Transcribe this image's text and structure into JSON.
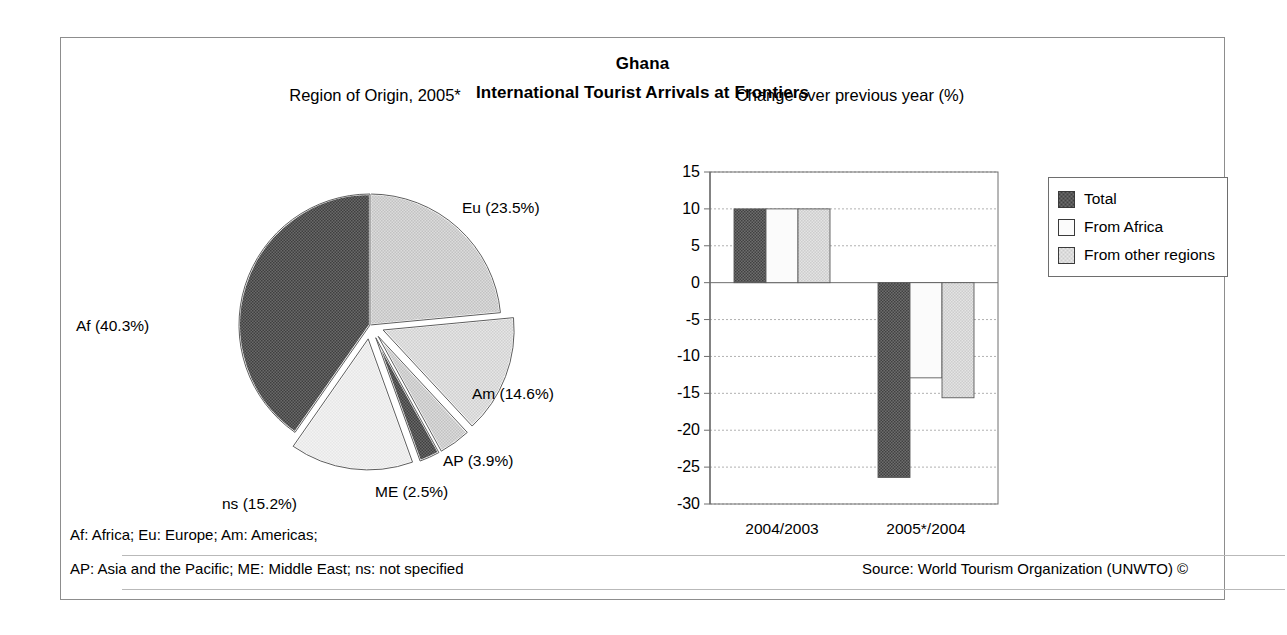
{
  "header": {
    "title": "Ghana",
    "subtitle": "International Tourist Arrivals at Frontiers"
  },
  "panels": {
    "pie_title": "Region of Origin, 2005*",
    "bar_title": "Change over previous year (%)"
  },
  "footnotes": {
    "line1": "Af: Africa; Eu: Europe; Am: Americas;",
    "line2": "AP: Asia and the Pacific; ME: Middle East; ns: not specified",
    "source": "Source: World Tourism Organization (UNWTO) ©"
  },
  "legend": {
    "items": [
      {
        "label": "Total",
        "color": "#595959",
        "pattern": "dark-checker"
      },
      {
        "label": "From Africa",
        "color": "#fbfbfb",
        "pattern": "plain-white"
      },
      {
        "label": "From other regions",
        "color": "#d9d9d9",
        "pattern": "light-checker"
      }
    ]
  },
  "colors": {
    "frame_border": "#8d8d8d",
    "axis": "#6e6e6e",
    "gridline": "#a8a8a8",
    "dark_fill": "#595959",
    "mid_fill": "#c9c9c9",
    "light_fill": "#d9d9d9",
    "white_fill": "#fbfbfb",
    "text": "#000000"
  },
  "chart_data": [
    {
      "type": "pie",
      "title": "Region of Origin, 2005*",
      "unit": "%",
      "legend_position": "labels-outside",
      "labels": [
        "Af (40.3%)",
        "Eu (23.5%)",
        "Am (14.6%)",
        "AP (3.9%)",
        "ME (2.5%)",
        "ns (15.2%)"
      ],
      "categories": [
        "Af",
        "Eu",
        "Am",
        "AP",
        "ME",
        "ns"
      ],
      "category_names": [
        "Africa",
        "Europe",
        "Americas",
        "Asia and the Pacific",
        "Middle East",
        "not specified"
      ],
      "values": [
        40.3,
        23.5,
        14.6,
        3.9,
        2.5,
        15.2
      ],
      "slice_fills": [
        "#595959",
        "#d3d3d3",
        "#d9d9d9",
        "#c9c9c9",
        "#5a5a5a",
        "#efefef"
      ],
      "exploded": [
        false,
        false,
        true,
        true,
        true,
        true
      ],
      "start_angle_deg": 0,
      "direction": "clockwise"
    },
    {
      "type": "bar",
      "title": "Change over previous year (%)",
      "xlabel": "",
      "ylabel": "",
      "ylim": [
        -30,
        15
      ],
      "yticks": [
        15,
        10,
        5,
        0,
        -5,
        -10,
        -15,
        -20,
        -25,
        -30
      ],
      "ytick_labels": [
        "15",
        "10",
        "5",
        "0",
        "-5",
        "-10",
        "-15",
        "-20",
        "-25",
        "-30"
      ],
      "grid": true,
      "legend_position": "right",
      "categories": [
        "2004/2003",
        "2005*/2004"
      ],
      "series": [
        {
          "name": "Total",
          "values": [
            10.0,
            -26.4
          ],
          "color": "#595959"
        },
        {
          "name": "From Africa",
          "values": [
            10.0,
            -12.9
          ],
          "color": "#fbfbfb"
        },
        {
          "name": "From other regions",
          "values": [
            10.0,
            -15.6
          ],
          "color": "#d9d9d9"
        }
      ]
    }
  ]
}
